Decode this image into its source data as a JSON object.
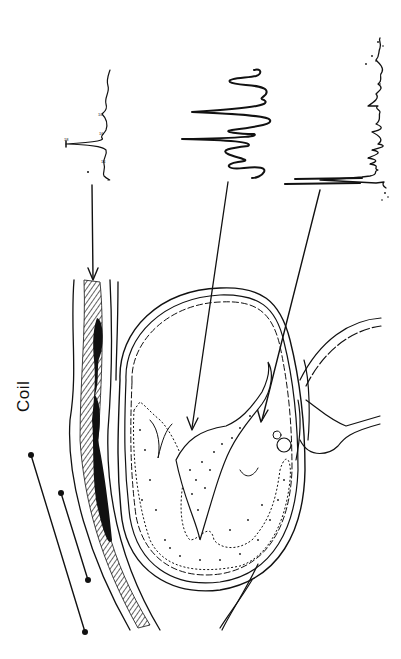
{
  "figure": {
    "type": "anatomical-diagram",
    "orientation": "rotated 90deg (landscape figure shown in portrait)",
    "ink_color": "#111111",
    "background_color": "#ffffff",
    "labels": {
      "coil": "Coil"
    },
    "coil": {
      "description": "surface coil shown as two parallel lines with dot terminals, placed outside the chest wall",
      "terminals": 4
    },
    "spectra": [
      {
        "id": "spectrum-1",
        "description": "sharp single-peak spectrum with small labelled minor peaks",
        "target": "chest wall skeletal muscle (hatched layer)"
      },
      {
        "id": "spectrum-2",
        "description": "broad multi-oscillation spectrum",
        "target": "interventricular septum / myocardium"
      },
      {
        "id": "spectrum-3",
        "description": "noisy spectrum with sharp initial doublet",
        "target": "ventricular cavity blood"
      }
    ],
    "arrows": 3
  }
}
